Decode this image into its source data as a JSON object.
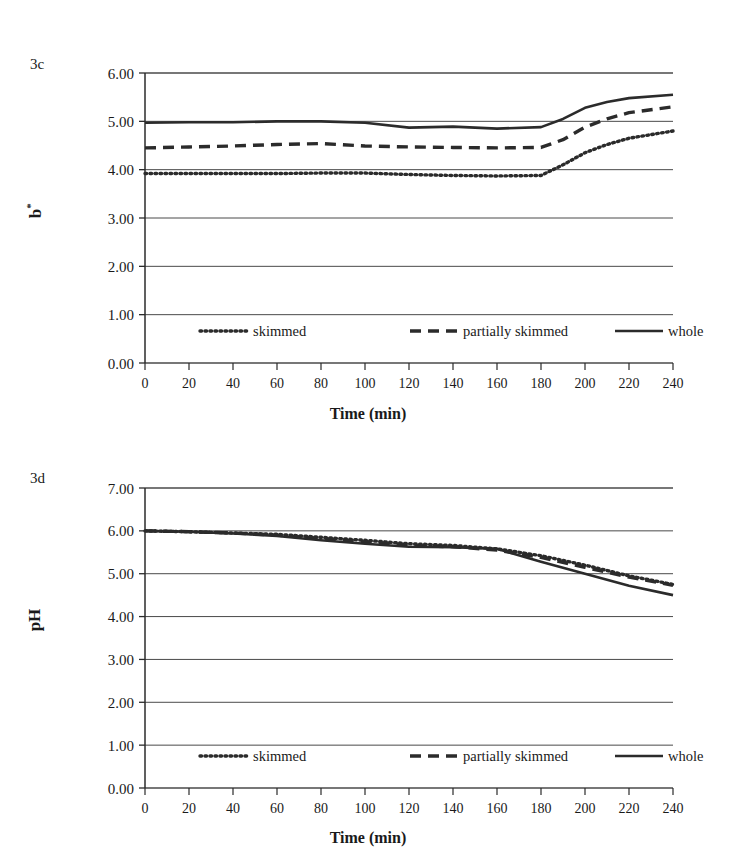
{
  "figure": {
    "panels": [
      {
        "id": "3c",
        "label": "3c",
        "ylabel": "b*",
        "xlabel": "Time (min)"
      },
      {
        "id": "3d",
        "label": "3d",
        "ylabel": "pH",
        "xlabel": "Time (min)"
      }
    ],
    "legend": {
      "items": [
        {
          "label": "skimmed",
          "style": "dotted"
        },
        {
          "label": "partially skimmed",
          "style": "dashed"
        },
        {
          "label": "whole",
          "style": "solid"
        }
      ]
    }
  },
  "chart_data": [
    {
      "type": "line",
      "id": "3c",
      "title": "3c",
      "xlabel": "Time (min)",
      "ylabel": "b*",
      "xlim": [
        0,
        240
      ],
      "ylim": [
        0,
        6
      ],
      "yticks": [
        "0.00",
        "1.00",
        "2.00",
        "3.00",
        "4.00",
        "5.00",
        "6.00"
      ],
      "xticks": [
        0,
        20,
        40,
        60,
        80,
        100,
        120,
        140,
        160,
        180,
        200,
        220,
        240
      ],
      "grid": true,
      "legend_position": "inside-bottom",
      "x": [
        0,
        20,
        40,
        60,
        80,
        100,
        120,
        140,
        160,
        180,
        190,
        200,
        210,
        220,
        240
      ],
      "series": [
        {
          "name": "skimmed",
          "style": "dotted",
          "values": [
            3.92,
            3.92,
            3.92,
            3.92,
            3.93,
            3.93,
            3.9,
            3.88,
            3.87,
            3.88,
            4.1,
            4.35,
            4.52,
            4.65,
            4.8
          ]
        },
        {
          "name": "partially skimmed",
          "style": "dashed",
          "values": [
            4.45,
            4.47,
            4.49,
            4.52,
            4.54,
            4.49,
            4.47,
            4.46,
            4.45,
            4.46,
            4.62,
            4.88,
            5.05,
            5.18,
            5.3
          ]
        },
        {
          "name": "whole",
          "style": "solid",
          "values": [
            4.97,
            4.98,
            4.98,
            5.0,
            5.0,
            4.97,
            4.87,
            4.89,
            4.85,
            4.88,
            5.05,
            5.28,
            5.4,
            5.48,
            5.55
          ]
        }
      ]
    },
    {
      "type": "line",
      "id": "3d",
      "title": "3d",
      "xlabel": "Time (min)",
      "ylabel": "pH",
      "xlim": [
        0,
        240
      ],
      "ylim": [
        0,
        7
      ],
      "yticks": [
        "0.00",
        "1.00",
        "2.00",
        "3.00",
        "4.00",
        "5.00",
        "6.00",
        "7.00"
      ],
      "xticks": [
        0,
        20,
        40,
        60,
        80,
        100,
        120,
        140,
        160,
        180,
        200,
        220,
        240
      ],
      "grid": true,
      "legend_position": "inside-bottom",
      "x": [
        0,
        20,
        40,
        60,
        80,
        100,
        120,
        140,
        160,
        180,
        200,
        220,
        240
      ],
      "series": [
        {
          "name": "skimmed",
          "style": "dotted",
          "values": [
            6.0,
            5.98,
            5.95,
            5.92,
            5.85,
            5.78,
            5.7,
            5.66,
            5.58,
            5.42,
            5.2,
            4.95,
            4.75
          ]
        },
        {
          "name": "partially skimmed",
          "style": "dashed",
          "values": [
            6.0,
            5.98,
            5.95,
            5.9,
            5.82,
            5.74,
            5.66,
            5.63,
            5.55,
            5.38,
            5.15,
            4.92,
            4.73
          ]
        },
        {
          "name": "whole",
          "style": "solid",
          "values": [
            6.0,
            5.98,
            5.94,
            5.88,
            5.78,
            5.7,
            5.63,
            5.62,
            5.58,
            5.28,
            5.0,
            4.72,
            4.5
          ]
        }
      ]
    }
  ]
}
